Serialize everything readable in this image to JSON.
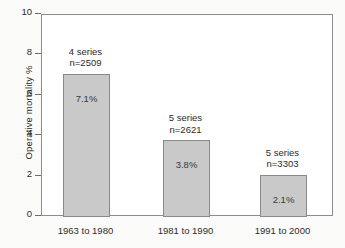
{
  "chart_data": {
    "type": "bar",
    "title": "",
    "subtitle": "",
    "xlabel": "",
    "ylabel": "Operative mortality %",
    "ylim": [
      0,
      10
    ],
    "ytick_values": [
      10,
      8,
      6,
      4,
      2,
      0
    ],
    "ytick_labels": [
      "10",
      "8",
      "6",
      "4",
      "2",
      "0"
    ],
    "grid": false,
    "legend": null,
    "categories": [
      "1963 to 1980",
      "1981 to 1990",
      "1991 to 2000"
    ],
    "values": [
      7.1,
      3.8,
      2.1
    ],
    "value_labels": [
      "7.1%",
      "3.8%",
      "2.1%"
    ],
    "annotations": [
      {
        "series": "4 series",
        "n": "n=2509"
      },
      {
        "series": "5 series",
        "n": "n=2621"
      },
      {
        "series": "5 series",
        "n": "n=3303"
      }
    ],
    "bar_fill_color": "#c9c9c9",
    "bar_edge_color": "#8a8a8a",
    "axis_color": "#8d8d8d",
    "text_color": "#2b2b2b",
    "background_color": "#fbfbfa",
    "plot_background_color": "#ffffff"
  }
}
